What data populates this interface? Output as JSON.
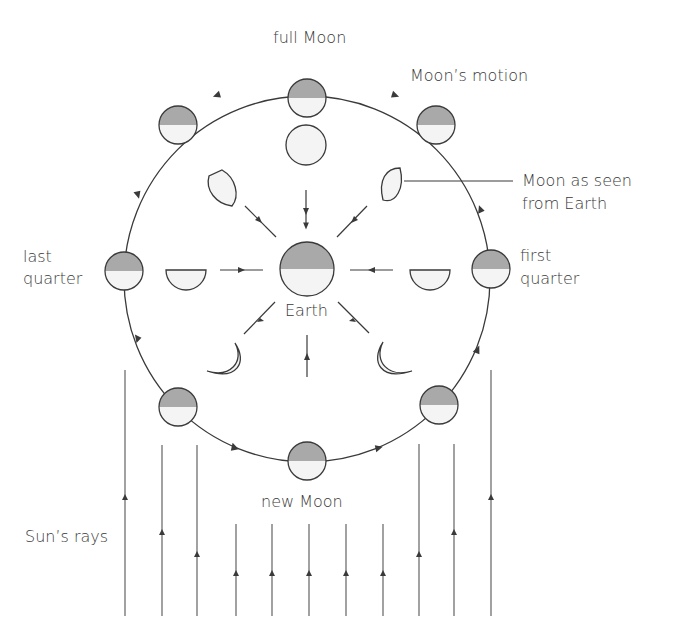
{
  "diagram": {
    "colors": {
      "stroke": "#3a3a3a",
      "shadow": "#a9a9a9",
      "lit": "#f4f4f4",
      "text": "#3a3a3a"
    },
    "labels": {
      "full_moon": "full Moon",
      "moons_motion": "Moon’s motion",
      "seen_from_earth_line1": "Moon as seen",
      "seen_from_earth_line2": "from Earth",
      "last_quarter_line1": "last",
      "last_quarter_line2": "quarter",
      "first_quarter_line1": "first",
      "first_quarter_line2": "quarter",
      "earth": "Earth",
      "new_moon": "new Moon",
      "suns_rays": "Sun’s rays"
    },
    "orbit_positions": [
      "full Moon",
      "waning gibbous",
      "last quarter",
      "waning crescent",
      "new Moon",
      "waxing crescent",
      "first quarter",
      "waxing gibbous"
    ],
    "apparent_phases": [
      "full",
      "gibbous",
      "half",
      "crescent",
      "new",
      "crescent",
      "half",
      "gibbous"
    ],
    "motion_direction": "anticlockwise",
    "sun_direction": "from bottom"
  }
}
